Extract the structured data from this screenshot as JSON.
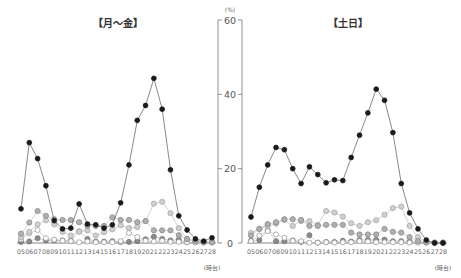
{
  "chart_data": [
    {
      "type": "line",
      "title": "【月～金】",
      "xlabel": "",
      "x_unit_label": "(時台)",
      "ylabel": "(%)",
      "ylim": [
        0,
        60
      ],
      "yticks": [
        0,
        20,
        40,
        60
      ],
      "grid": false,
      "legend": null,
      "categories": [
        "05",
        "06",
        "07",
        "08",
        "09",
        "10",
        "11",
        "12",
        "13",
        "14",
        "15",
        "16",
        "17",
        "18",
        "19",
        "20",
        "21",
        "22",
        "23",
        "24",
        "25",
        "26",
        "27",
        "28"
      ],
      "series": [
        {
          "name": "series-black",
          "color": "#222222",
          "marker": "filled-dark",
          "values": [
            9.2,
            27,
            22.7,
            15.4,
            6,
            3.8,
            4,
            10.5,
            5.1,
            4.9,
            4,
            4.9,
            10.8,
            21,
            33,
            37,
            44.3,
            36,
            19.7,
            7.3,
            3.5,
            1.1,
            0.5,
            1.4
          ]
        },
        {
          "name": "series-gray-1",
          "color": "#aaaaaa",
          "marker": "gray",
          "values": [
            2.5,
            5.5,
            8.6,
            7.3,
            6.4,
            6.2,
            6.2,
            5.6,
            4.6,
            4.6,
            4.6,
            6.9,
            6.2,
            6.2,
            5.6,
            5.9,
            3.4,
            3.4,
            3.4,
            2.1,
            1.1,
            0.5,
            0.3,
            0.3
          ]
        },
        {
          "name": "series-gray-2",
          "color": "#bbbbbb",
          "marker": "light-gray",
          "values": [
            1.5,
            3,
            5,
            6.1,
            5,
            3,
            2,
            3.1,
            3.4,
            2,
            2.9,
            3.7,
            4.8,
            4,
            4.3,
            5.9,
            10.6,
            11.1,
            8,
            4,
            1,
            0.5,
            0.2,
            0.2
          ]
        },
        {
          "name": "series-open",
          "color": "#cccccc",
          "marker": "open",
          "values": [
            1,
            2.6,
            3.5,
            1.3,
            0.9,
            0.6,
            0.5,
            0.2,
            0.4,
            0.2,
            0.2,
            0.2,
            0.5,
            2.7,
            1.6,
            0.6,
            0.4,
            0.6,
            0.3,
            0.3,
            0.2,
            0.1,
            0.1,
            0.1
          ]
        },
        {
          "name": "series-mid",
          "color": "#888888",
          "marker": "mid-gray",
          "values": [
            0.3,
            0.4,
            1.3,
            0.7,
            0.7,
            0.7,
            0.6,
            3.1,
            1.1,
            0.4,
            0.4,
            0.5,
            0.3,
            0.3,
            0.5,
            1,
            1.7,
            1.1,
            0.7,
            0.9,
            0.2,
            0.2,
            0.2,
            0.2
          ]
        }
      ]
    },
    {
      "type": "line",
      "title": "【土日】",
      "xlabel": "",
      "x_unit_label": "(時台)",
      "ylabel": "(%)",
      "ylim": [
        0,
        60
      ],
      "yticks": [
        0,
        20,
        40,
        60
      ],
      "grid": false,
      "legend": null,
      "categories": [
        "05",
        "06",
        "07",
        "08",
        "09",
        "10",
        "11",
        "12",
        "13",
        "14",
        "15",
        "16",
        "17",
        "18",
        "19",
        "20",
        "21",
        "22",
        "23",
        "24",
        "25",
        "26",
        "27",
        "28"
      ],
      "series": [
        {
          "name": "series-black",
          "color": "#222222",
          "marker": "filled-dark",
          "values": [
            7,
            15,
            21,
            25.7,
            25.1,
            20,
            16,
            20.5,
            18.4,
            16.2,
            17,
            16.8,
            23,
            29,
            35,
            41.4,
            38.4,
            29.7,
            16,
            8.1,
            3.8,
            0.8,
            0,
            0
          ]
        },
        {
          "name": "series-gray-1",
          "color": "#aaaaaa",
          "marker": "gray",
          "values": [
            2,
            3.8,
            5.1,
            5.6,
            6.4,
            6.4,
            6.2,
            4.6,
            4.6,
            4.9,
            4.9,
            4.9,
            2.8,
            2.3,
            2.3,
            2.3,
            3.8,
            3,
            2.8,
            1.6,
            0.5,
            0.2,
            0.1,
            0.1
          ]
        },
        {
          "name": "series-gray-2",
          "color": "#bbbbbb",
          "marker": "light-gray",
          "values": [
            2.7,
            3.8,
            4.6,
            5.2,
            6.2,
            4.6,
            5.9,
            5.9,
            4.9,
            8.6,
            8.2,
            7.1,
            5.3,
            4.6,
            5.6,
            6.1,
            7.6,
            9.4,
            9.8,
            4.6,
            1.6,
            0.3,
            0.1,
            0.1
          ]
        },
        {
          "name": "series-open",
          "color": "#cccccc",
          "marker": "open",
          "values": [
            0.5,
            2,
            3.2,
            2.3,
            1.4,
            0.6,
            0.5,
            0.1,
            0.1,
            0.2,
            0.1,
            0.2,
            0.2,
            0.5,
            0.4,
            0.2,
            0.2,
            0.2,
            0.2,
            0.1,
            0.1,
            0.1,
            0.1,
            0.1
          ]
        },
        {
          "name": "series-mid",
          "color": "#888888",
          "marker": "mid-gray",
          "values": [
            0.6,
            0.8,
            3.4,
            0.5,
            0.5,
            0.7,
            0.3,
            2.1,
            0.1,
            0.3,
            0.3,
            0.6,
            0.4,
            0.8,
            0.8,
            0.8,
            0.9,
            0.5,
            0.5,
            0.4,
            0.2,
            0.2,
            0.1,
            0.1
          ]
        }
      ]
    }
  ],
  "axis": {
    "unit": "(%)",
    "ticks": [
      "60",
      "40",
      "20",
      "0"
    ]
  },
  "x_unit": "(時台)"
}
